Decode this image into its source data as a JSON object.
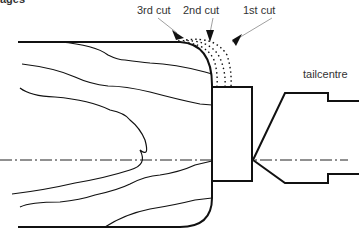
{
  "heading": {
    "clipped_text": "ages"
  },
  "labels": {
    "cut3": "3rd cut",
    "cut2": "2nd cut",
    "cut1": "1st cut",
    "tailcentre": "tailcentre"
  },
  "colors": {
    "line": "#111111",
    "text": "#333333",
    "background": "#ffffff"
  },
  "components": [
    {
      "name": "wood-blank",
      "description": "rounded blank with grain lines"
    },
    {
      "name": "spigot",
      "description": "rectangular tenon at right end of blank"
    },
    {
      "name": "tailcentre",
      "description": "cone-pointed tailstock centre"
    },
    {
      "name": "centreline",
      "description": "dash-dot axis of rotation"
    },
    {
      "name": "cut-zones",
      "description": "dotted successive cut profiles on the corner"
    }
  ]
}
